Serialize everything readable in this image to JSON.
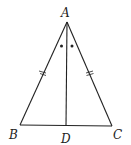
{
  "diagram": {
    "type": "geometry",
    "shape": "isosceles triangle with angle bisector",
    "points": {
      "A": {
        "label": "A",
        "x": 67,
        "y": 22
      },
      "B": {
        "label": "B",
        "x": 20,
        "y": 125
      },
      "C": {
        "label": "C",
        "x": 112,
        "y": 126
      },
      "D": {
        "label": "D",
        "x": 66,
        "y": 126
      }
    },
    "segments": [
      "AB",
      "AC",
      "BC",
      "AD"
    ],
    "equal_marks": [
      "AB",
      "AC"
    ],
    "equal_angle_marks": [
      "BAD",
      "DAC"
    ],
    "colors": {
      "stroke": "#222222",
      "background": "#ffffff"
    }
  }
}
